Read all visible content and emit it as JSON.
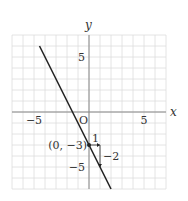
{
  "chart_data": {
    "type": "line",
    "title": "",
    "xlabel": "x",
    "ylabel": "y",
    "origin_label": "O",
    "xlim": [
      -7,
      7
    ],
    "ylim": [
      -7,
      7
    ],
    "grid": true,
    "x_tick_labels": [
      {
        "value": -5,
        "label": "−5"
      },
      {
        "value": 5,
        "label": "5"
      }
    ],
    "y_tick_labels": [
      {
        "value": 5,
        "label": "5"
      },
      {
        "value": -5,
        "label": "−5"
      }
    ],
    "line": {
      "slope": -2,
      "intercept": -3,
      "x_from": -4.5,
      "x_to": 2
    },
    "point": {
      "x": 0,
      "y": -3,
      "label": "(0, −3)"
    },
    "slope_step": {
      "run": 1,
      "rise": -2,
      "run_label": "1",
      "rise_label": "−2"
    }
  }
}
